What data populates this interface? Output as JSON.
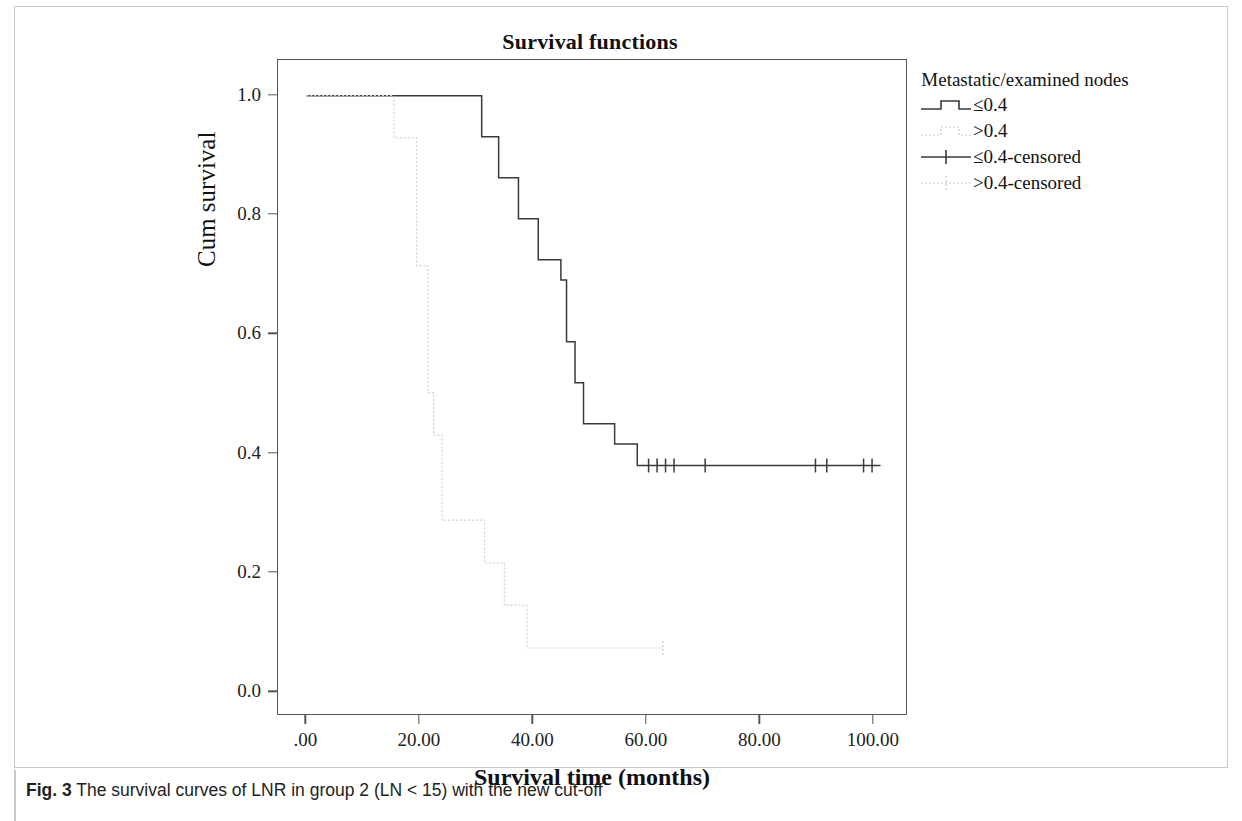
{
  "figure": {
    "caption_label": "Fig. 3",
    "caption_text": "The survival curves of LNR in group 2 (LN < 15) with the new cut-off"
  },
  "legend": {
    "title": "Metastatic/examined nodes",
    "items": [
      {
        "label": "≤0.4",
        "key": "step-solid",
        "color": "#3a3a3a"
      },
      {
        "label": ">0.4",
        "key": "step-dotted",
        "color": "#c9c9c9"
      },
      {
        "label": "≤0.4-censored",
        "key": "plus-solid",
        "color": "#3a3a3a"
      },
      {
        "label": ">0.4-censored",
        "key": "plus-dotted",
        "color": "#c9c9c9"
      }
    ]
  },
  "chart_data": {
    "type": "line",
    "title": "Survival functions",
    "xlabel": "Survival time (months)",
    "ylabel": "Cum survival",
    "xlim": [
      -5,
      106
    ],
    "ylim": [
      -0.04,
      1.06
    ],
    "xticks": [
      0,
      20,
      40,
      60,
      80,
      100
    ],
    "xtick_labels": [
      ".00",
      "20.00",
      "40.00",
      "60.00",
      "80.00",
      "100.00"
    ],
    "yticks": [
      0.0,
      0.2,
      0.4,
      0.6,
      0.8,
      1.0
    ],
    "ytick_labels": [
      "0.0",
      "0.2",
      "0.4",
      "0.6",
      "0.8",
      "1.0"
    ],
    "grid": false,
    "legend_position": "right",
    "step_style": "post",
    "series": [
      {
        "name": "≤0.4",
        "style": "solid",
        "color": "#3a3a3a",
        "points": [
          [
            0.0,
            1.0
          ],
          [
            29.5,
            1.0
          ],
          [
            31.0,
            0.931
          ],
          [
            33.0,
            0.931
          ],
          [
            34.0,
            0.862
          ],
          [
            36.5,
            0.862
          ],
          [
            37.5,
            0.793
          ],
          [
            39.5,
            0.793
          ],
          [
            41.0,
            0.724
          ],
          [
            44.0,
            0.724
          ],
          [
            45.0,
            0.69
          ],
          [
            46.0,
            0.586
          ],
          [
            47.5,
            0.517
          ],
          [
            49.0,
            0.448
          ],
          [
            53.0,
            0.448
          ],
          [
            54.5,
            0.414
          ],
          [
            57.5,
            0.414
          ],
          [
            58.5,
            0.378
          ],
          [
            101.5,
            0.378
          ]
        ],
        "censored": [
          60.5,
          62.0,
          63.5,
          65.0,
          70.5,
          90.0,
          92.0,
          98.5,
          100.0
        ]
      },
      {
        "name": ">0.4",
        "style": "dotted",
        "color": "#cfcfcf",
        "points": [
          [
            0.0,
            1.0
          ],
          [
            14.5,
            1.0
          ],
          [
            15.5,
            0.929
          ],
          [
            18.5,
            0.929
          ],
          [
            19.5,
            0.714
          ],
          [
            21.0,
            0.714
          ],
          [
            21.5,
            0.5
          ],
          [
            22.5,
            0.429
          ],
          [
            24.0,
            0.286
          ],
          [
            30.5,
            0.286
          ],
          [
            31.5,
            0.214
          ],
          [
            33.5,
            0.214
          ],
          [
            35.0,
            0.143
          ],
          [
            38.0,
            0.143
          ],
          [
            39.0,
            0.071
          ],
          [
            63.0,
            0.071
          ]
        ],
        "censored": [
          63.0
        ]
      }
    ]
  }
}
